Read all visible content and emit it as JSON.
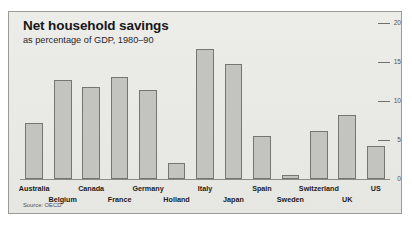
{
  "chart": {
    "title": "Net household savings",
    "subtitle": "as percentage of GDP, 1980–90",
    "source": "Source: OECD"
  },
  "chart_data": {
    "type": "bar",
    "title": "Net household savings",
    "subtitle": "as percentage of GDP, 1980–90",
    "xlabel": "",
    "ylabel": "",
    "ylim": [
      0,
      20
    ],
    "yticks": [
      0,
      5,
      10,
      15,
      20
    ],
    "ytick_labels": [
      "0",
      "5",
      "10",
      "15",
      "20"
    ],
    "axis_position": "right",
    "grid": false,
    "legend": null,
    "annotations": [
      "Source: OECD"
    ],
    "bar_color": "#c3c3bf",
    "bar_edge_color": "#76766f",
    "background_color": "#e9e9e6",
    "categories": [
      "Australia",
      "Belgium",
      "Canada",
      "France",
      "Germany",
      "Holland",
      "Italy",
      "Japan",
      "Spain",
      "Sweden",
      "Switzerland",
      "UK",
      "US"
    ],
    "values": [
      7.2,
      12.7,
      11.8,
      13.1,
      11.4,
      2.0,
      16.7,
      14.7,
      5.5,
      0.5,
      6.2,
      8.2,
      4.2
    ],
    "label_rows": [
      "top",
      "bottom",
      "top",
      "bottom",
      "top",
      "bottom",
      "top",
      "bottom",
      "top",
      "bottom",
      "top",
      "bottom",
      "top"
    ]
  }
}
